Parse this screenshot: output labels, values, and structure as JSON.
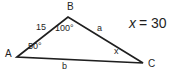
{
  "diagram": {
    "type": "triangle",
    "vertices": {
      "A": "A",
      "B": "B",
      "C": "C"
    },
    "side_labels": {
      "AB": "15",
      "BC": "a",
      "AC": "b"
    },
    "angle_labels": {
      "A": "50°",
      "B": "100°",
      "C": "x"
    },
    "equation": {
      "lhs": "x",
      "rhs": "= 30"
    },
    "colors": {
      "line": "#1f1f1f",
      "text": "#1f1f1f",
      "background": "#ffffff"
    }
  }
}
